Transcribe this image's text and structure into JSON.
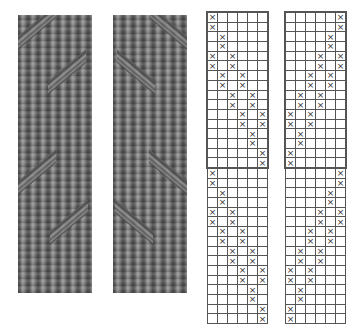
{
  "figure": {
    "swatches": [
      {
        "name": "swatch-left",
        "description": "knitted fabric with diagonal purl stripes rising left-to-right"
      },
      {
        "name": "swatch-right",
        "description": "knitted fabric with diagonal purl stripes rising right-to-left (mirror)"
      }
    ],
    "charts": [
      {
        "name": "chart-left",
        "columns": 6,
        "symbol": "×",
        "sections": [
          {
            "highlighted": true,
            "rows": [
              [
                0
              ],
              [
                0
              ],
              [
                1
              ],
              [
                1
              ],
              [
                0,
                2
              ],
              [
                0,
                2
              ],
              [
                1,
                3
              ],
              [
                1,
                3
              ],
              [
                2,
                4
              ],
              [
                2,
                4
              ],
              [
                3,
                5
              ],
              [
                3,
                5
              ],
              [
                4
              ],
              [
                4
              ],
              [
                5
              ],
              [
                5
              ]
            ]
          },
          {
            "highlighted": false,
            "rows": [
              [
                0
              ],
              [
                0
              ],
              [
                1
              ],
              [
                1
              ],
              [
                0,
                2
              ],
              [
                0,
                2
              ],
              [
                1,
                3
              ],
              [
                1,
                3
              ],
              [
                2,
                4
              ],
              [
                2,
                4
              ],
              [
                3,
                5
              ],
              [
                3,
                5
              ],
              [
                4
              ],
              [
                4
              ],
              [
                5
              ],
              [
                5
              ]
            ]
          }
        ]
      },
      {
        "name": "chart-right",
        "columns": 6,
        "symbol": "×",
        "sections": [
          {
            "highlighted": true,
            "rows": [
              [
                5
              ],
              [
                5
              ],
              [
                4
              ],
              [
                4
              ],
              [
                3,
                5
              ],
              [
                3,
                5
              ],
              [
                2,
                4
              ],
              [
                2,
                4
              ],
              [
                1,
                3
              ],
              [
                1,
                3
              ],
              [
                0,
                2
              ],
              [
                0,
                2
              ],
              [
                1
              ],
              [
                1
              ],
              [
                0
              ],
              [
                0
              ]
            ]
          },
          {
            "highlighted": false,
            "rows": [
              [
                5
              ],
              [
                5
              ],
              [
                4
              ],
              [
                4
              ],
              [
                3,
                5
              ],
              [
                3,
                5
              ],
              [
                2,
                4
              ],
              [
                2,
                4
              ],
              [
                1,
                3
              ],
              [
                1,
                3
              ],
              [
                0,
                2
              ],
              [
                0,
                2
              ],
              [
                1
              ],
              [
                1
              ],
              [
                0
              ],
              [
                0
              ]
            ]
          }
        ]
      }
    ],
    "colors": {
      "grid": "#555555",
      "symbol": "#333333",
      "fabric": "#6f6f6f"
    }
  }
}
